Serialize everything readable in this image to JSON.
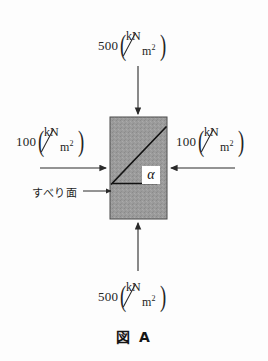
{
  "figure": {
    "caption": "図 A",
    "caption_kanji": "図",
    "caption_letter": "A",
    "background_color": "#fdfdfd",
    "block": {
      "name": "soil-element",
      "fill_color": "#9a9a9a",
      "border_color": "#3a3a3a",
      "x": 110,
      "y": 117,
      "width": 57,
      "height": 102
    },
    "slip_plane": {
      "label": "すべり面",
      "angle_symbol": "α",
      "line_color": "#141414"
    },
    "loads": [
      {
        "position": "top",
        "magnitude": "500",
        "unit_numerator": "kN",
        "unit_denominator": "m",
        "unit_exponent": "2",
        "direction": "down"
      },
      {
        "position": "left",
        "magnitude": "100",
        "unit_numerator": "kN",
        "unit_denominator": "m",
        "unit_exponent": "2",
        "direction": "right"
      },
      {
        "position": "right",
        "magnitude": "100",
        "unit_numerator": "kN",
        "unit_denominator": "m",
        "unit_exponent": "2",
        "direction": "left"
      },
      {
        "position": "bottom",
        "magnitude": "500",
        "unit_numerator": "kN",
        "unit_denominator": "m",
        "unit_exponent": "2",
        "direction": "up"
      }
    ]
  }
}
